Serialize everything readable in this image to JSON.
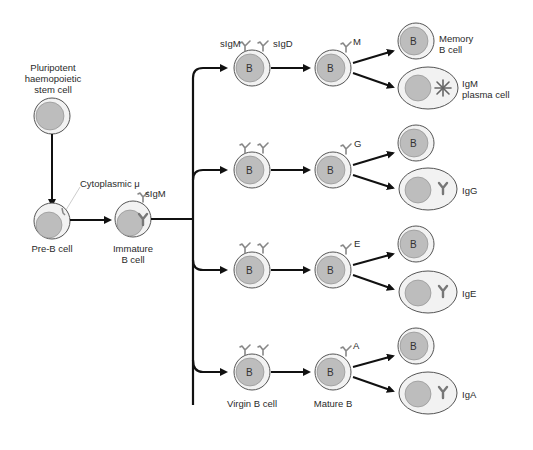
{
  "colors": {
    "cell_outline": "#555555",
    "cytoplasm": "#f2f2f2",
    "nucleus": "#b8b8b8",
    "arrow": "#111111",
    "receptor": "#888888"
  },
  "stages": {
    "stem_cell": {
      "label": "Pluripotent\nhaemopoietic\nstem cell"
    },
    "pre_b": {
      "label": "Pre-B cell",
      "annotation": "Cytoplasmic μ"
    },
    "immature_b": {
      "label": "Immature\nB cell",
      "receptor_label": "sIgM"
    },
    "virgin_b": {
      "label": "Virgin B cell",
      "receptor_labels": [
        "sIgM",
        "sIgD"
      ],
      "nucleus_letter": "B"
    },
    "mature_b": {
      "label": "Mature B",
      "nucleus_letter": "B"
    }
  },
  "branches": [
    {
      "isotype": "M",
      "memory_label": "Memory\nB cell",
      "plasma_label": "IgM\nplasma cell",
      "memory_letter": "B"
    },
    {
      "isotype": "G",
      "plasma_label": "IgG",
      "memory_letter": "B"
    },
    {
      "isotype": "E",
      "plasma_label": "IgE",
      "memory_letter": "B"
    },
    {
      "isotype": "A",
      "plasma_label": "IgA",
      "memory_letter": "B"
    }
  ]
}
